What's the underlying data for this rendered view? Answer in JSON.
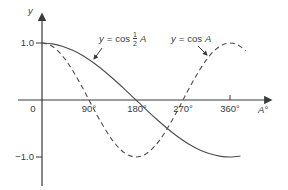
{
  "chart_data": {
    "type": "line",
    "title": "",
    "xlabel": "A°",
    "ylabel": "y",
    "x_tick_labels": [
      "0",
      "90°",
      "180°",
      "270°",
      "360°"
    ],
    "x_tick_values": [
      0,
      90,
      180,
      270,
      360
    ],
    "y_tick_labels": [
      "1.0",
      "−1.0"
    ],
    "y_tick_values": [
      1,
      -1
    ],
    "xlim": [
      -40,
      410
    ],
    "ylim": [
      -1.55,
      1.55
    ],
    "grid": false,
    "legend_position": "inline-labels-with-arrows",
    "series": [
      {
        "name": "y = cos ½A",
        "line_style": "solid",
        "x": [
          0,
          20,
          40,
          60,
          80,
          100,
          120,
          140,
          160,
          180,
          200,
          220,
          240,
          260,
          280,
          300,
          320,
          340,
          360,
          380
        ],
        "y": [
          1,
          0.985,
          0.94,
          0.866,
          0.766,
          0.643,
          0.5,
          0.342,
          0.174,
          0,
          -0.174,
          -0.342,
          -0.5,
          -0.643,
          -0.766,
          -0.866,
          -0.94,
          -0.985,
          -1,
          -0.985
        ]
      },
      {
        "name": "y = cos A",
        "line_style": "dashed",
        "x": [
          0,
          15,
          30,
          45,
          60,
          75,
          90,
          105,
          120,
          135,
          150,
          165,
          180,
          195,
          210,
          225,
          240,
          255,
          270,
          285,
          300,
          315,
          330,
          345,
          360,
          375,
          390
        ],
        "y": [
          1,
          0.966,
          0.866,
          0.707,
          0.5,
          0.259,
          0,
          -0.259,
          -0.5,
          -0.707,
          -0.866,
          -0.966,
          -1,
          -0.966,
          -0.866,
          -0.707,
          -0.5,
          -0.259,
          0,
          0.259,
          0.5,
          0.707,
          0.866,
          0.966,
          1,
          0.966,
          0.866
        ]
      }
    ],
    "colors": {
      "curve": "#4d4d4d",
      "axis": "#3a3a3a",
      "text": "#3a3a3a",
      "background": "#ffffff"
    }
  },
  "legend": {
    "solid": {
      "var": "y",
      "equals": "=",
      "func": "cos",
      "num": "1",
      "den": "2",
      "arg": "A"
    },
    "dashed": {
      "var": "y",
      "equals": "=",
      "func": "cos",
      "arg": "A"
    }
  }
}
